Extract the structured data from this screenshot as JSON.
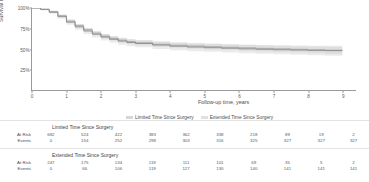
{
  "chart_data": {
    "type": "line",
    "title": "",
    "xlabel": "Follow-up time, years",
    "ylabel": "Survival Probability",
    "xlim": [
      0,
      9.4
    ],
    "ylim": [
      0,
      1.0
    ],
    "xticks": [
      0,
      1,
      2,
      3,
      4,
      5,
      6,
      7,
      8,
      9
    ],
    "xticklabels": [
      "0",
      "1",
      "2",
      "3",
      "4",
      "5",
      "6",
      "7",
      "8",
      "9"
    ],
    "yticks": [
      0.25,
      0.5,
      0.75,
      1.0
    ],
    "yticklabels": [
      "25%",
      "50%",
      "75%",
      "100%"
    ],
    "grid": false,
    "legend_position": "bottom-center",
    "series": [
      {
        "name": "Limited Time Since Surgery",
        "color": "#9b9b9b",
        "band_color": "#c9c9c9",
        "x": [
          0,
          0.25,
          0.5,
          0.75,
          1.0,
          1.25,
          1.5,
          1.75,
          2.0,
          2.25,
          2.5,
          2.75,
          3.0,
          3.5,
          4.0,
          4.5,
          5.0,
          5.5,
          6.0,
          6.5,
          7.0,
          7.5,
          8.0,
          8.5,
          9.0
        ],
        "values": [
          1.0,
          0.985,
          0.955,
          0.905,
          0.84,
          0.785,
          0.735,
          0.693,
          0.657,
          0.63,
          0.607,
          0.59,
          0.576,
          0.558,
          0.545,
          0.536,
          0.528,
          0.521,
          0.514,
          0.508,
          0.502,
          0.496,
          0.49,
          0.485,
          0.481
        ],
        "lower": [
          1.0,
          0.978,
          0.943,
          0.888,
          0.82,
          0.763,
          0.712,
          0.668,
          0.631,
          0.603,
          0.58,
          0.562,
          0.547,
          0.528,
          0.514,
          0.504,
          0.495,
          0.487,
          0.479,
          0.471,
          0.464,
          0.456,
          0.448,
          0.44,
          0.433
        ],
        "upper": [
          1.0,
          0.991,
          0.967,
          0.921,
          0.859,
          0.806,
          0.757,
          0.717,
          0.682,
          0.656,
          0.634,
          0.617,
          0.604,
          0.587,
          0.575,
          0.567,
          0.56,
          0.554,
          0.548,
          0.544,
          0.539,
          0.535,
          0.531,
          0.528,
          0.526
        ]
      },
      {
        "name": "Extended Time Since Surgery",
        "color": "#848484",
        "band_color": "#d2d2d2",
        "x": [
          0,
          0.25,
          0.5,
          0.75,
          1.0,
          1.25,
          1.5,
          1.75,
          2.0,
          2.25,
          2.5,
          2.75,
          3.0,
          3.5,
          4.0,
          4.5,
          5.0,
          5.5,
          6.0,
          6.5,
          7.0,
          7.5,
          8.0,
          8.5,
          9.0
        ],
        "values": [
          1.0,
          0.982,
          0.948,
          0.895,
          0.827,
          0.77,
          0.72,
          0.68,
          0.645,
          0.618,
          0.596,
          0.58,
          0.567,
          0.548,
          0.534,
          0.524,
          0.516,
          0.509,
          0.502,
          0.496,
          0.491,
          0.487,
          0.483,
          0.48,
          0.477
        ],
        "lower": [
          1.0,
          0.972,
          0.93,
          0.87,
          0.797,
          0.736,
          0.684,
          0.641,
          0.604,
          0.576,
          0.552,
          0.534,
          0.52,
          0.5,
          0.485,
          0.474,
          0.465,
          0.457,
          0.449,
          0.442,
          0.436,
          0.43,
          0.424,
          0.419,
          0.414
        ],
        "upper": [
          1.0,
          0.991,
          0.965,
          0.919,
          0.856,
          0.802,
          0.755,
          0.717,
          0.684,
          0.659,
          0.638,
          0.623,
          0.611,
          0.594,
          0.582,
          0.573,
          0.566,
          0.56,
          0.554,
          0.55,
          0.546,
          0.543,
          0.541,
          0.539,
          0.538
        ]
      }
    ]
  },
  "legend": {
    "items": [
      {
        "label": "Limited Time Since Surgery",
        "color": "#b5b5b5"
      },
      {
        "label": "Extended Time Since Surgery",
        "color": "#c6c6c6"
      }
    ]
  },
  "risk_tables": [
    {
      "title": "Limited Time Since Surgery",
      "rows": [
        {
          "label": "At Risk",
          "values": [
            "682",
            "524",
            "422",
            "383",
            "362",
            "338",
            "218",
            "89",
            "19",
            "2"
          ]
        },
        {
          "label": "Events",
          "values": [
            "0",
            "154",
            "252",
            "298",
            "303",
            "316",
            "325",
            "327",
            "327",
            "327"
          ]
        }
      ]
    },
    {
      "title": "Extended Time Since Surgery",
      "rows": [
        {
          "label": "At Risk",
          "values": [
            "247",
            "175",
            "134",
            "119",
            "111",
            "101",
            "69",
            "35",
            "5",
            "2"
          ]
        },
        {
          "label": "Events",
          "values": [
            "0",
            "66",
            "106",
            "119",
            "127",
            "130",
            "140",
            "141",
            "141",
            "141"
          ]
        }
      ]
    }
  ]
}
